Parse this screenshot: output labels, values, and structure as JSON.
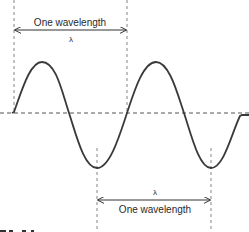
{
  "diagram": {
    "top_annotation": {
      "label": "One wavelength",
      "symbol": "λ"
    },
    "bottom_annotation": {
      "symbol": "λ",
      "label": "One wavelength"
    },
    "colors": {
      "wave": "#3a3a3a",
      "dashed": "#555555",
      "text": "#2a2a2a"
    }
  }
}
